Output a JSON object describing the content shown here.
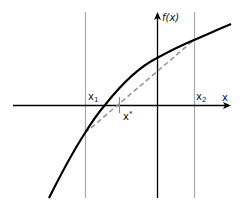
{
  "diagram": {
    "labels": {
      "y_axis": "f(x)",
      "x_axis": "x",
      "x1": "x",
      "x1_sub": "1",
      "x2": "x",
      "x2_sub": "2",
      "xstar": "x",
      "xstar_sup": "*"
    },
    "colors": {
      "curve": "#000000",
      "axes": "#000000",
      "bracket_lines": "#aaaaaa",
      "secant": "#999999"
    }
  }
}
